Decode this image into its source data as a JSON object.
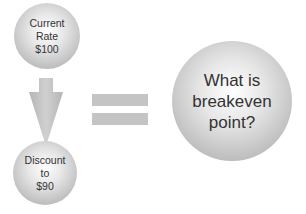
{
  "diagram": {
    "top_circle": {
      "lines": [
        "Current",
        "Rate",
        "$100"
      ]
    },
    "bottom_circle": {
      "lines": [
        "Discount",
        "to",
        "$90"
      ]
    },
    "result_circle": {
      "lines": [
        "What is",
        "breakeven",
        "point?"
      ]
    },
    "connectors": {
      "arrow": "down-arrow",
      "equals": "equals-sign"
    },
    "colors": {
      "circle_light": "#ffffff",
      "circle_dark": "#a8a8a8",
      "shape_gray": "#c4c4c4",
      "text": "#333333"
    }
  }
}
